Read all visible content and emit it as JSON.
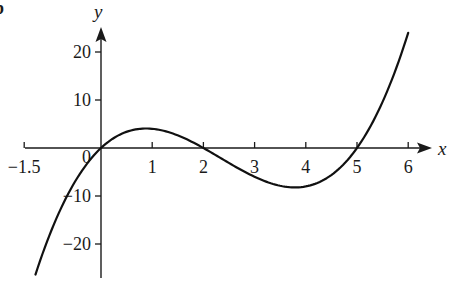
{
  "part_label": "b",
  "chart_data": {
    "type": "line",
    "title": "",
    "function": "y = x(x-2)(x-5)",
    "xlabel": "x",
    "ylabel": "y",
    "xlim": [
      -1.5,
      6.4
    ],
    "ylim": [
      -27,
      25
    ],
    "grid": false,
    "legend": null,
    "x_ticks": [
      {
        "value": -1.5,
        "label": "−1.5"
      },
      {
        "value": 1,
        "label": "1"
      },
      {
        "value": 2,
        "label": "2"
      },
      {
        "value": 3,
        "label": "3"
      },
      {
        "value": 4,
        "label": "4"
      },
      {
        "value": 5,
        "label": "5"
      },
      {
        "value": 6,
        "label": "6"
      }
    ],
    "y_ticks": [
      {
        "value": 20,
        "label": "20"
      },
      {
        "value": 10,
        "label": "10"
      },
      {
        "value": -10,
        "label": "−10"
      },
      {
        "value": -20,
        "label": "−20"
      }
    ],
    "origin_label": "0",
    "series": [
      {
        "name": "curve",
        "x": [
          -1.28,
          -1,
          -0.5,
          0,
          0.5,
          0.88,
          1,
          1.5,
          2,
          2.5,
          3,
          3.5,
          3.79,
          4,
          4.5,
          5,
          5.5,
          6
        ],
        "y": [
          -26.4,
          -18,
          -6.88,
          0,
          3.38,
          4.06,
          4,
          2.63,
          0,
          -3.13,
          -6,
          -7.88,
          -8.21,
          -8,
          -5.63,
          0,
          9.63,
          24
        ]
      }
    ],
    "annotations": {
      "roots": [
        0,
        2,
        5
      ],
      "local_max": {
        "x": 0.88,
        "y": 4.06
      },
      "local_min": {
        "x": 3.79,
        "y": -8.21
      }
    }
  }
}
